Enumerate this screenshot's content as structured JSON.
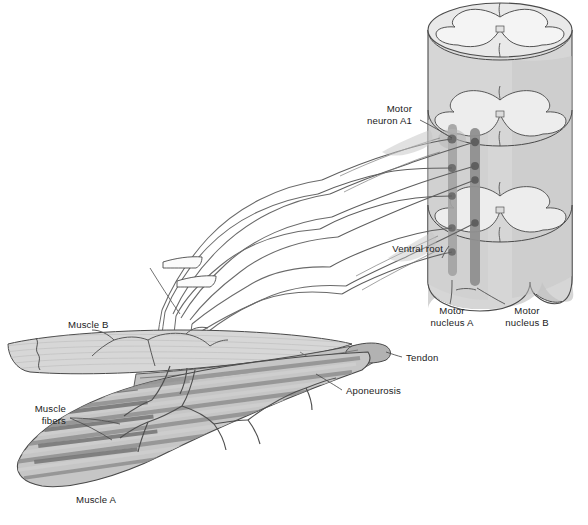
{
  "figure": {
    "background_color": "#ffffff"
  },
  "labels": {
    "motor_neuron_a1": "Motor\nneuron A1",
    "motor_neuron_a1_line1": "Motor",
    "motor_neuron_a1_line2": "neuron A1",
    "ventral_root": "Ventral root",
    "motor_nucleus_a_line1": "Motor",
    "motor_nucleus_a_line2": "nucleus A",
    "motor_nucleus_b_line1": "Motor",
    "motor_nucleus_b_line2": "nucleus B",
    "muscle_b": "Muscle B",
    "muscle_a": "Muscle A",
    "muscle_fibers_line1": "Muscle",
    "muscle_fibers_line2": "fibers",
    "tendon": "Tendon",
    "aponeurosis": "Aponeurosis"
  },
  "colors": {
    "outline": "#4a4a4a",
    "outline_dark": "#3a3a3a",
    "text": "#1b1b1b",
    "cord_fill": "#d8d8d8",
    "cord_face": "#e6e6e6",
    "gray_matter": "#f2f2f2",
    "nucleus_column": "#9e9e9e",
    "neuron_soma": "#6b6b6b",
    "muscle_a_fill": "#c9c9c9",
    "muscle_b_fill": "#d5d5d5",
    "tendon_fill": "#bdbdbd",
    "aponeurosis_fill": "#b5b5b5",
    "fiber_dark": "#8e8e8e",
    "fiber_light": "#cfcfcf",
    "nerve": "#5a5a5a",
    "axon": "#707070"
  },
  "structures": {
    "spinal_cord": {
      "name": "spinal cord",
      "segments": 3,
      "description": "stacked cylindrical cord segments with butterfly-shaped gray matter"
    },
    "motor_nucleus_a": {
      "name": "Motor nucleus A",
      "neuron_count": 5,
      "orientation": "vertical column"
    },
    "motor_nucleus_b": {
      "name": "Motor nucleus B",
      "neuron_count": 4,
      "orientation": "vertical column"
    },
    "nerve_bundle": {
      "name": "peripheral nerve",
      "break_mark": true,
      "axon_count": 9
    },
    "muscle_a": {
      "name": "Muscle A",
      "shape": "fusiform belly with striated fibers"
    },
    "muscle_b": {
      "name": "Muscle B",
      "shape": "flat sheet with torn tendon end"
    }
  }
}
